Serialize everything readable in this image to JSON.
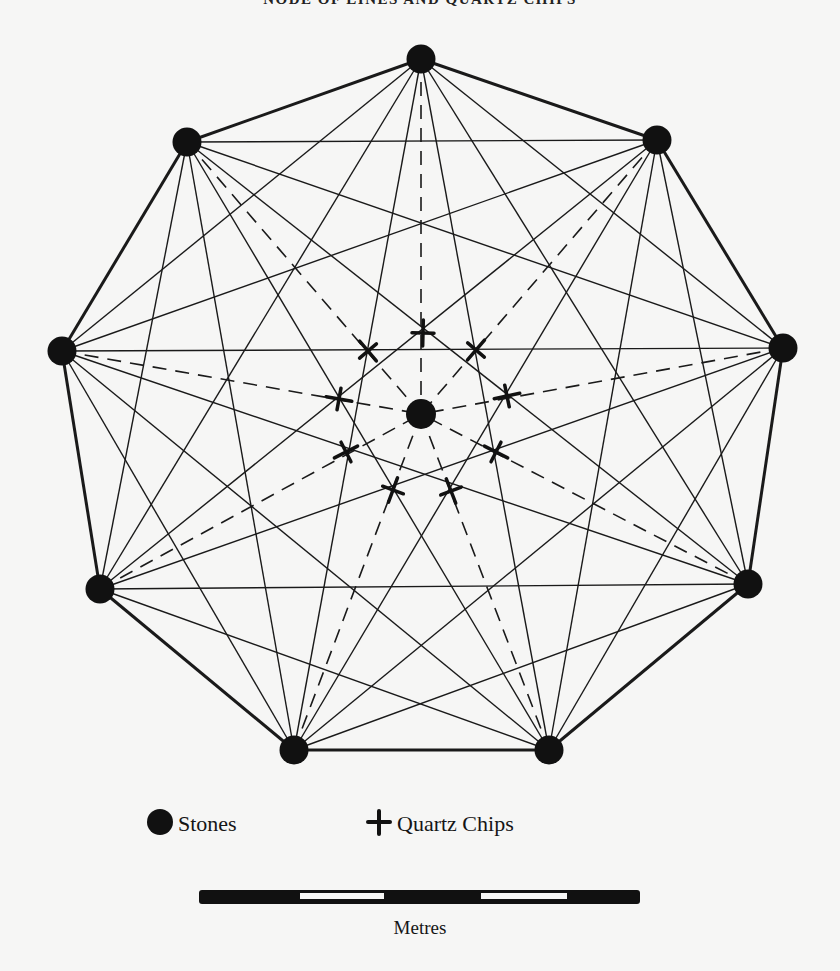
{
  "title": "NODE OF LINES AND QUARTZ CHIPS",
  "diagram": {
    "outer_stones": [
      "top",
      "upper-right",
      "right",
      "lower-right",
      "bottom-right",
      "bottom-left",
      "lower-left",
      "left",
      "upper-left"
    ],
    "center_stone": "center",
    "solid_lines": "every outer stone connected to every other outer stone",
    "perimeter": "thicker solid lines between adjacent outer stones",
    "dashed_lines": "each outer stone connected to the center stone",
    "quartz_chips_count": 9,
    "stones_count": 10
  },
  "legend": {
    "stones_label": "Stones",
    "quartz_label": "Quartz Chips"
  },
  "scale": {
    "label": "Metres",
    "segments": 5
  }
}
